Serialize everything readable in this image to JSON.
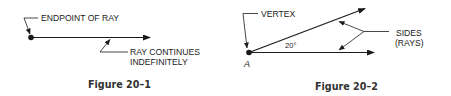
{
  "figures": [
    {
      "caption": "Figure 20–1",
      "labels": {
        "endpoint": "ENDPOINT OF RAY",
        "continues_line1": "RAY CONTINUES",
        "continues_line2": "INDEFINITELY"
      }
    },
    {
      "caption": "Figure 20–2",
      "labels": {
        "vertex": "VERTEX",
        "sides_line1": "SIDES",
        "sides_line2": "(RAYS)",
        "angle": "20°",
        "point": "A"
      }
    }
  ],
  "colors": {
    "ink": "#1a1a1a",
    "caption": "#333333",
    "background": "#ffffff"
  }
}
